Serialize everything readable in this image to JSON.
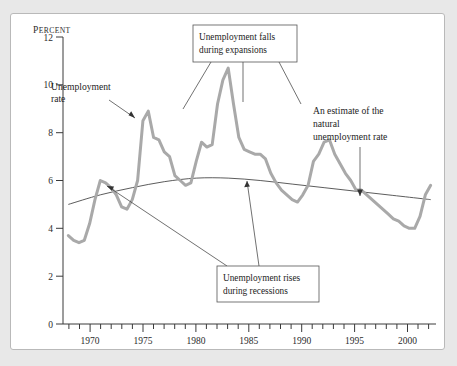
{
  "chart_data": {
    "type": "line",
    "title": "",
    "xlabel": "",
    "ylabel": "Percent",
    "ylabel_display": "Percent",
    "xlim": [
      1967.5,
      2002.5
    ],
    "ylim": [
      0,
      12
    ],
    "grid": false,
    "legend": "none",
    "y_ticks": [
      0,
      2,
      4,
      6,
      8,
      10,
      12
    ],
    "x_ticks_major": [
      1970,
      1975,
      1980,
      1985,
      1990,
      1995,
      2000
    ],
    "x_ticks_minor_step": 1,
    "series": [
      {
        "name": "Unemployment rate",
        "color": "#a9a9a9",
        "x": [
          1968,
          1968.5,
          1969,
          1969.5,
          1970,
          1970.5,
          1971,
          1971.5,
          1972,
          1972.5,
          1973,
          1973.5,
          1974,
          1974.5,
          1975,
          1975.5,
          1976,
          1976.5,
          1977,
          1977.5,
          1978,
          1978.5,
          1979,
          1979.5,
          1980,
          1980.5,
          1981,
          1981.5,
          1982,
          1982.5,
          1983,
          1983.5,
          1984,
          1984.5,
          1985,
          1985.5,
          1986,
          1986.5,
          1987,
          1987.5,
          1988,
          1988.5,
          1989,
          1989.5,
          1990,
          1990.5,
          1991,
          1991.5,
          1992,
          1992.5,
          1993,
          1993.5,
          1994,
          1994.5,
          1995,
          1995.5,
          1996,
          1996.5,
          1997,
          1997.5,
          1998,
          1998.5,
          1999,
          1999.5,
          2000,
          2000.5,
          2001,
          2001.5,
          2002
        ],
        "y": [
          3.7,
          3.5,
          3.4,
          3.5,
          4.2,
          5.2,
          6.0,
          5.9,
          5.7,
          5.4,
          4.9,
          4.8,
          5.2,
          6.0,
          8.5,
          8.9,
          7.8,
          7.7,
          7.2,
          7.0,
          6.2,
          6.0,
          5.8,
          5.9,
          6.8,
          7.6,
          7.4,
          7.5,
          9.2,
          10.2,
          10.7,
          9.2,
          7.8,
          7.3,
          7.2,
          7.1,
          7.1,
          6.9,
          6.3,
          5.9,
          5.6,
          5.4,
          5.2,
          5.1,
          5.4,
          5.8,
          6.8,
          7.1,
          7.6,
          7.7,
          7.1,
          6.7,
          6.3,
          6.0,
          5.6,
          5.6,
          5.4,
          5.2,
          5.0,
          4.8,
          4.6,
          4.4,
          4.3,
          4.1,
          4.0,
          4.0,
          4.5,
          5.4,
          5.8
        ]
      },
      {
        "name": "Natural rate of unemployment",
        "color": "#4a4a4a",
        "x": [
          1968,
          1971,
          1974,
          1977,
          1980,
          1983,
          1986,
          1989,
          1992,
          1995,
          1998,
          2001,
          2002
        ],
        "y": [
          5.0,
          5.4,
          5.7,
          5.95,
          6.1,
          6.1,
          6.0,
          5.85,
          5.7,
          5.55,
          5.4,
          5.25,
          5.2
        ]
      }
    ],
    "annotations": [
      {
        "id": "unemployment-rate-label",
        "text_lines": [
          "Unemployment",
          "rate"
        ],
        "style": "plain",
        "points_to": "1975 peak"
      },
      {
        "id": "falls-expansions-callout",
        "text_lines": [
          "Unemployment falls",
          "during expansions"
        ],
        "style": "box",
        "points_to": "expansion downswings"
      },
      {
        "id": "rises-recessions-callout",
        "text_lines": [
          "Unemployment rises",
          "during recessions"
        ],
        "style": "box",
        "points_to": "recession upswings"
      },
      {
        "id": "natural-rate-label",
        "text_lines": [
          "An estimate of the",
          "natural",
          "unemployment rate"
        ],
        "style": "plain",
        "points_to": "natural rate curve"
      }
    ]
  }
}
